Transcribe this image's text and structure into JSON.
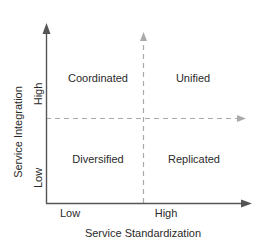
{
  "diagram": {
    "type": "2x2 matrix",
    "x_axis": {
      "title": "Service Standardization",
      "low_label": "Low",
      "high_label": "High"
    },
    "y_axis": {
      "title": "Service Integration",
      "low_label": "Low",
      "high_label": "High"
    },
    "quadrants": {
      "top_left": "Coordinated",
      "top_right": "Unified",
      "bottom_left": "Diversified",
      "bottom_right": "Replicated"
    },
    "colors": {
      "axis": "#555555",
      "divider": "#aaaaaa",
      "text": "#2a2a2a"
    }
  }
}
